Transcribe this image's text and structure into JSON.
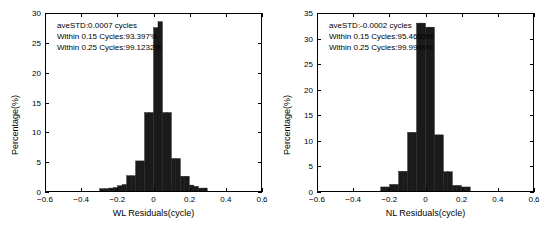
{
  "figure": {
    "background": "#ffffff",
    "bar_color": "#1a1a1a",
    "axis_color": "#000000"
  },
  "panels": [
    {
      "id": "wl",
      "xlabel": "WL Residuals(cycle)",
      "ylabel": "Percentage(%)",
      "annotation": {
        "line1": "aveSTD:0.0007 cycles",
        "line2": "Within 0.15 Cycles:93.397%",
        "line3": "Within 0.25 Cycles:99.1232%"
      },
      "xticks": [
        "-0.6",
        "-0.4",
        "-0.2",
        "0",
        "0.2",
        "0.4",
        "0.6"
      ],
      "yticks": [
        "0",
        "5",
        "10",
        "15",
        "20",
        "25",
        "30"
      ]
    },
    {
      "id": "nl",
      "xlabel": "NL Residuals(cycle)",
      "ylabel": "Percentage(%)",
      "annotation": {
        "line1": "aveSTD:-0.0002 cycles",
        "line2": "Within 0.15 Cycles:95.4693%",
        "line3": "Within 0.25 Cycles:99.9999%"
      },
      "xticks": [
        "-0.6",
        "-0.4",
        "-0.2",
        "0",
        "0.2",
        "0.4",
        "0.6"
      ],
      "yticks": [
        "0",
        "5",
        "10",
        "15",
        "20",
        "25",
        "30",
        "35"
      ]
    }
  ],
  "chart_data": [
    {
      "type": "bar",
      "title": "",
      "xlabel": "WL Residuals(cycle)",
      "ylabel": "Percentage(%)",
      "xlim": [
        -0.6,
        0.6
      ],
      "ylim": [
        0,
        30
      ],
      "grid": false,
      "legend": null,
      "bin_width": 0.025,
      "bin_centers": [
        -0.2875,
        -0.2625,
        -0.2375,
        -0.2125,
        -0.1875,
        -0.1625,
        -0.1375,
        -0.1125,
        -0.0875,
        -0.0625,
        -0.0375,
        -0.0125,
        0.0125,
        0.0375,
        0.0625,
        0.0875,
        0.1125,
        0.1375,
        0.1625,
        0.1875,
        0.2125,
        0.2375,
        0.2625,
        0.2875
      ],
      "values": [
        0.4,
        0.4,
        0.5,
        0.6,
        0.9,
        1.1,
        2.6,
        2.6,
        5.1,
        5.1,
        13.3,
        13.3,
        27.7,
        28.7,
        13.3,
        13.3,
        5.5,
        5.5,
        2.5,
        2.5,
        1.0,
        0.8,
        0.5,
        0.5
      ],
      "annotations": [
        "aveSTD:0.0007 cycles",
        "Within 0.15 Cycles:93.397%",
        "Within 0.25 Cycles:99.1232%"
      ]
    },
    {
      "type": "bar",
      "title": "",
      "xlabel": "NL Residuals(cycle)",
      "ylabel": "Percentage(%)",
      "xlim": [
        -0.6,
        0.6
      ],
      "ylim": [
        0,
        35
      ],
      "grid": false,
      "legend": null,
      "bin_width": 0.025,
      "bin_centers": [
        -0.2375,
        -0.2125,
        -0.1875,
        -0.1625,
        -0.1375,
        -0.1125,
        -0.0875,
        -0.0625,
        -0.0375,
        -0.0125,
        0.0125,
        0.0375,
        0.0625,
        0.0875,
        0.1125,
        0.1375,
        0.1625,
        0.1875,
        0.2125,
        0.2375
      ],
      "values": [
        0.8,
        0.8,
        1.3,
        1.3,
        3.9,
        3.9,
        11.6,
        11.6,
        33.2,
        33.2,
        32.4,
        32.4,
        11.1,
        11.1,
        3.8,
        3.8,
        1.1,
        1.1,
        0.8,
        0.8
      ],
      "annotations": [
        "aveSTD:-0.0002 cycles",
        "Within 0.15 Cycles:95.4693%",
        "Within 0.25 Cycles:99.9999%"
      ]
    }
  ]
}
